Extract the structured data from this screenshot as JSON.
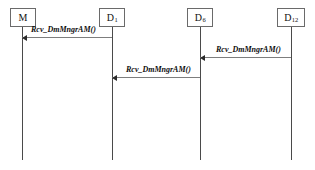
{
  "diagram": {
    "type": "uml-sequence-diagram",
    "width": 315,
    "height": 170,
    "background_color": "#ffffff",
    "lifeline_color": "#4a4a4a",
    "message_line_color": "#7d7d7d",
    "box_border_color": "#6a6a6a",
    "text_color": "#101010",
    "participants": [
      {
        "id": "M",
        "name": "M",
        "subscript": "",
        "box_x": 10,
        "box_y": 8,
        "box_w": 26,
        "box_h": 19,
        "lifeline_x": 22,
        "lifeline_top": 27,
        "lifeline_bottom": 160
      },
      {
        "id": "D1",
        "name": "D",
        "subscript": "1",
        "box_x": 99,
        "box_y": 8,
        "box_w": 26,
        "box_h": 19,
        "lifeline_x": 112,
        "lifeline_top": 27,
        "lifeline_bottom": 160
      },
      {
        "id": "D6",
        "name": "D",
        "subscript": "6",
        "box_x": 187,
        "box_y": 8,
        "box_w": 26,
        "box_h": 19,
        "lifeline_x": 200,
        "lifeline_top": 27,
        "lifeline_bottom": 160
      },
      {
        "id": "D12",
        "name": "D",
        "subscript": "12",
        "box_x": 277,
        "box_y": 8,
        "box_w": 28,
        "box_h": 19,
        "lifeline_x": 291,
        "lifeline_top": 27,
        "lifeline_bottom": 160
      }
    ],
    "messages": [
      {
        "label": "Rcv_DmMngrAM()",
        "from": "D1",
        "to": "M",
        "direction": "left",
        "y": 37,
        "x_start": 22,
        "x_end": 112,
        "label_x": 31,
        "label_y": 26
      },
      {
        "label": "Rcv_DmMngrAM()",
        "from": "D12",
        "to": "D6",
        "direction": "left",
        "y": 57,
        "x_start": 200,
        "x_end": 291,
        "label_x": 216,
        "label_y": 46
      },
      {
        "label": "Rcv_DmMngrAM()",
        "from": "D6",
        "to": "D1",
        "direction": "left",
        "y": 77,
        "x_start": 112,
        "x_end": 200,
        "label_x": 126,
        "label_y": 66
      }
    ]
  }
}
